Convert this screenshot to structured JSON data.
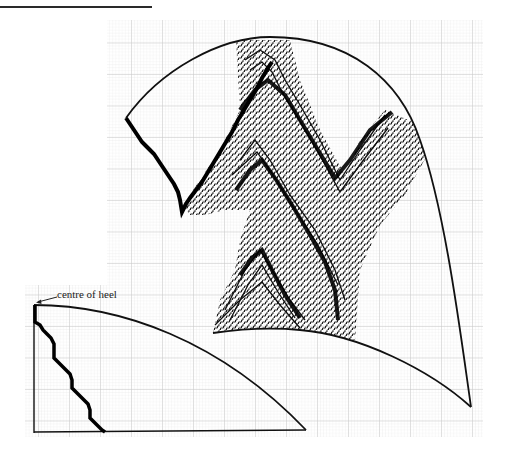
{
  "figure": {
    "title_rule": true,
    "annotation": "centre of heel"
  },
  "colors": {
    "ink": "#111111",
    "grid_fine": "#e4e4e4",
    "grid_major": "#c8c8c8",
    "paper": "#ffffff"
  },
  "grid": {
    "main": {
      "x": 107,
      "y": 20,
      "w": 376,
      "h": 417,
      "fine": 3.1,
      "major": 31
    },
    "heel": {
      "x": 25,
      "y": 285,
      "w": 82,
      "h": 152,
      "fine": 3.1,
      "major": 31
    }
  }
}
